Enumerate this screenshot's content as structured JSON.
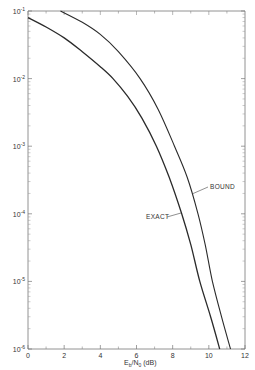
{
  "chart_data": {
    "type": "line",
    "title": "",
    "xlabel": "E_b/N_0 (dB)",
    "ylabel": "",
    "xlim": [
      0,
      12
    ],
    "ylim": [
      1e-06,
      0.1
    ],
    "yscale": "log",
    "grid": false,
    "legend": "none (inline annotations)",
    "x_ticks": [
      0,
      2,
      4,
      6,
      8,
      10,
      12
    ],
    "x_tick_labels": [
      "0",
      "2",
      "4",
      "6",
      "8",
      "10",
      "12"
    ],
    "y_ticks": [
      0.1,
      0.01,
      0.001,
      0.0001,
      1e-05,
      1e-06
    ],
    "y_tick_labels": [
      "10^-1",
      "10^-2",
      "10^-3",
      "10^-4",
      "10^-5",
      "10^-6"
    ],
    "series": [
      {
        "name": "EXACT",
        "x": [
          0,
          1,
          2,
          3,
          4,
          4.7,
          5.5,
          6.3,
          7.1,
          7.8,
          8.5,
          9.0,
          9.5,
          10.1,
          10.6
        ],
        "y": [
          0.08,
          0.058,
          0.04,
          0.025,
          0.015,
          0.01,
          0.0055,
          0.0026,
          0.001,
          0.00035,
          0.0001,
          3.5e-05,
          1e-05,
          3e-06,
          1e-06
        ]
      },
      {
        "name": "BOUND",
        "x": [
          1.8,
          3,
          4,
          5,
          6.2,
          7.2,
          8.1,
          8.8,
          9.4,
          9.8,
          10.2,
          10.7,
          11.2
        ],
        "y": [
          0.1,
          0.068,
          0.045,
          0.025,
          0.01,
          0.0035,
          0.001,
          0.00035,
          0.0001,
          3.5e-05,
          1e-05,
          3e-06,
          1e-06
        ]
      }
    ],
    "annotations": [
      {
        "text": "EXACT",
        "points_to": "EXACT",
        "at": [
          8.5,
          0.0001
        ]
      },
      {
        "text": "BOUND",
        "points_to": "BOUND",
        "at": [
          9.0,
          0.0002
        ]
      }
    ]
  },
  "labels": {
    "exact": "EXACT",
    "bound": "BOUND",
    "xaxis_main": "E",
    "xaxis_sub1": "b",
    "xaxis_mid": "/N",
    "xaxis_sub2": "0",
    "xaxis_unit": "(dB)",
    "ytick_base": "10",
    "yticks_exp": [
      "-1",
      "-2",
      "-3",
      "-4",
      "-5",
      "-6"
    ],
    "xticks": [
      "0",
      "2",
      "4",
      "6",
      "8",
      "10",
      "12"
    ]
  }
}
